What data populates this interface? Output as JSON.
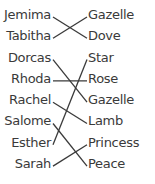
{
  "left_items": [
    "Jemima",
    "Tabitha",
    "Dorcas",
    "Rhoda",
    "Rachel",
    "Salome",
    "Esther",
    "Sarah"
  ],
  "right_items": [
    "Gazelle",
    "Dove",
    "Star",
    "Rose",
    "Gazelle",
    "Lamb",
    "Princess",
    "Peace"
  ],
  "connections": [
    {
      "from": 0,
      "to": 1
    },
    {
      "from": 1,
      "to": 0
    },
    {
      "from": 2,
      "to": 4
    },
    {
      "from": 3,
      "to": 3
    },
    {
      "from": 4,
      "to": 5
    },
    {
      "from": 5,
      "to": 7
    },
    {
      "from": 6,
      "to": 2
    },
    {
      "from": 7,
      "to": 6
    }
  ],
  "line_color": "#3a3a3a"
}
